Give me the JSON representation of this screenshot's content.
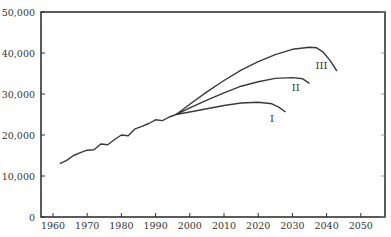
{
  "chart_data": {
    "type": "line",
    "title": "",
    "xlabel": "",
    "ylabel": "",
    "xlim": [
      1957,
      2059
    ],
    "ylim": [
      0,
      50000
    ],
    "grid": false,
    "legend": "inline labels",
    "x_ticks": [
      1960,
      1970,
      1980,
      1990,
      2000,
      2010,
      2020,
      2030,
      2040,
      2050
    ],
    "x_tick_labels": [
      "1960",
      "1970",
      "1980",
      "1990",
      "2000",
      "2010",
      "2020",
      "2030",
      "2040",
      "2050"
    ],
    "y_ticks": [
      0,
      10000,
      20000,
      30000,
      40000,
      50000
    ],
    "y_tick_labels": [
      "0",
      "10,000",
      "20,000",
      "30,000",
      "40,000",
      "50,000"
    ],
    "series": [
      {
        "name": "Historical",
        "label": "",
        "x": [
          1962,
          1964,
          1966,
          1968,
          1970,
          1972,
          1974,
          1976,
          1978,
          1980,
          1982,
          1984,
          1986,
          1988,
          1990,
          1992,
          1994,
          1996
        ],
        "values": [
          13000,
          13800,
          15000,
          15700,
          16300,
          16400,
          17800,
          17600,
          18900,
          20000,
          19800,
          21500,
          22100,
          22800,
          23700,
          23500,
          24400,
          25000
        ]
      },
      {
        "name": "Scenario I",
        "label": "I",
        "x": [
          1996,
          2000,
          2005,
          2010,
          2015,
          2020,
          2024,
          2026,
          2028
        ],
        "values": [
          25000,
          25600,
          26400,
          27200,
          27800,
          28000,
          27600,
          26800,
          25600
        ]
      },
      {
        "name": "Scenario II",
        "label": "II",
        "x": [
          1996,
          2000,
          2005,
          2010,
          2015,
          2020,
          2025,
          2030,
          2033,
          2035
        ],
        "values": [
          25000,
          26600,
          28500,
          30300,
          31900,
          33000,
          33800,
          34000,
          33700,
          32600
        ]
      },
      {
        "name": "Scenario III",
        "label": "III",
        "x": [
          1996,
          2000,
          2005,
          2010,
          2015,
          2020,
          2025,
          2030,
          2035,
          2037,
          2039,
          2041,
          2043
        ],
        "values": [
          25000,
          27500,
          30500,
          33300,
          35800,
          37900,
          39600,
          40900,
          41400,
          41300,
          40200,
          38200,
          35600
        ]
      }
    ]
  },
  "plot": {
    "x0_px": 53,
    "px_per_year": 3.42,
    "y0_px": 217,
    "px_per_unit": 0.0041,
    "frame": {
      "left": 41,
      "top": 12,
      "right": 385,
      "bottom": 217
    },
    "line_color": "#3a3a3a",
    "axis_color": "#333333"
  }
}
